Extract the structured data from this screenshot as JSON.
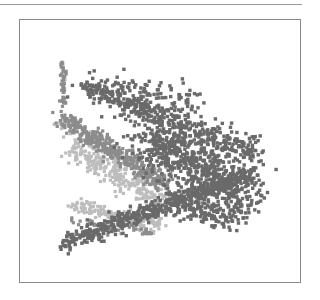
{
  "chart_data": {
    "type": "scatter",
    "title": "",
    "xlabel": "",
    "ylabel": "",
    "grid": false,
    "legend": null,
    "axes_visible": false,
    "frame": {
      "left": 19,
      "top": 19,
      "right": 300,
      "bottom": 282
    },
    "series": [
      {
        "name": "cluster-light",
        "color": "#bdbdbd",
        "marker_radius": 1.6,
        "segments": [
          {
            "x0": 70,
            "y0": 150,
            "x1": 170,
            "y1": 205,
            "spread": 9,
            "count": 260
          },
          {
            "x0": 72,
            "y0": 205,
            "x1": 160,
            "y1": 225,
            "spread": 6,
            "count": 160
          },
          {
            "x0": 60,
            "y0": 120,
            "x1": 120,
            "y1": 170,
            "spread": 6,
            "count": 60
          },
          {
            "x0": 62,
            "y0": 58,
            "x1": 64,
            "y1": 80,
            "spread": 2,
            "count": 8
          }
        ]
      },
      {
        "name": "cluster-medium",
        "color": "#8c8c8c",
        "marker_radius": 1.6,
        "segments": [
          {
            "x0": 62,
            "y0": 118,
            "x1": 165,
            "y1": 185,
            "spread": 8,
            "count": 420
          },
          {
            "x0": 63,
            "y0": 62,
            "x1": 64,
            "y1": 105,
            "spread": 2.5,
            "count": 40
          },
          {
            "x0": 70,
            "y0": 222,
            "x1": 150,
            "y1": 232,
            "spread": 4,
            "count": 50
          }
        ]
      },
      {
        "name": "cluster-dark",
        "color": "#6a6a6a",
        "marker_radius": 1.7,
        "segments": [
          {
            "x0": 85,
            "y0": 85,
            "x1": 258,
            "y1": 155,
            "spread": 12,
            "count": 480
          },
          {
            "x0": 65,
            "y0": 242,
            "x1": 250,
            "y1": 175,
            "spread": 8,
            "count": 520
          },
          {
            "x0": 150,
            "y0": 140,
            "x1": 245,
            "y1": 200,
            "spread": 22,
            "count": 700
          },
          {
            "x0": 110,
            "y0": 85,
            "x1": 200,
            "y1": 100,
            "spread": 12,
            "count": 70
          },
          {
            "x0": 170,
            "y0": 205,
            "x1": 235,
            "y1": 220,
            "spread": 10,
            "count": 120
          }
        ]
      }
    ]
  }
}
